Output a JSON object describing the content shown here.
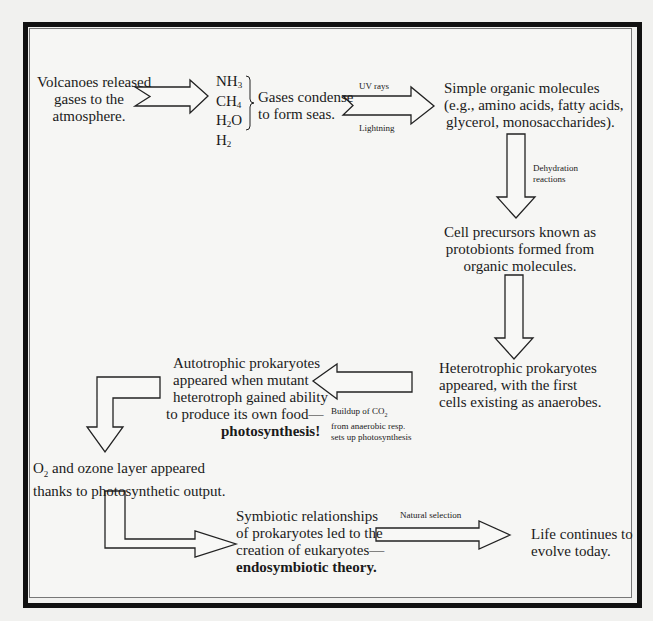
{
  "diagram": {
    "nodes": {
      "volcanoes": {
        "lines": [
          "Volcanoes released",
          "gases to the",
          "atmosphere."
        ]
      },
      "gases": [
        {
          "base": "NH",
          "sub": "3"
        },
        {
          "base": "CH",
          "sub": "4"
        },
        {
          "base": "H",
          "sub": "2",
          "tail": "O"
        },
        {
          "base": "H",
          "sub": "2"
        }
      ],
      "condense": {
        "lines": [
          "Gases condense",
          "to form seas."
        ]
      },
      "simple_organic": {
        "lines": [
          "Simple organic molecules",
          "(e.g., amino acids, fatty acids,",
          "glycerol, monosaccharides)."
        ]
      },
      "protobionts": {
        "lines": [
          "Cell precursors known as",
          "protobionts formed from",
          "organic molecules."
        ]
      },
      "heterotrophic": {
        "lines": [
          "Heterotrophic prokaryotes",
          "appeared, with the first",
          "cells existing as anaerobes."
        ]
      },
      "autotrophic": {
        "lines": [
          "Autotrophic prokaryotes",
          "appeared when mutant",
          "heterotroph gained ability",
          "to produce its own food—"
        ],
        "bold": "photosynthesis!"
      },
      "ozone": {
        "line1_pre": "O",
        "line1_sub": "2",
        "line1_post": " and ozone layer appeared",
        "line2": "thanks to photosynthetic output."
      },
      "symbiotic": {
        "lines": [
          "Symbiotic relationships",
          "of prokaryotes led to the",
          "creation of eukaryotes—"
        ],
        "bold": "endosymbiotic theory."
      },
      "life": {
        "lines": [
          "Life continues to",
          "evolve today."
        ]
      }
    },
    "arrow_labels": {
      "uv_rays": "UV rays",
      "lightning": "Lightning",
      "dehydration": [
        "Dehydration",
        "reactions"
      ],
      "buildup": {
        "line1_pre": "Buildup of CO",
        "line1_sub": "2",
        "line2": "from anaerobic resp.",
        "line3": "sets up photosynthesis"
      },
      "natural_selection": "Natural selection"
    }
  }
}
